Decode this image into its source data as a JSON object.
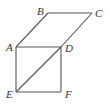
{
  "diagram": {
    "type": "geometry-figure",
    "points": {
      "A": "A",
      "B": "B",
      "C": "C",
      "D": "D",
      "E": "E",
      "F": "F"
    },
    "segments": [
      "AB",
      "BC",
      "CD",
      "DA",
      "AE",
      "EF",
      "FD",
      "ED"
    ],
    "colors": {
      "line": "#555555",
      "label": "#333333"
    }
  }
}
